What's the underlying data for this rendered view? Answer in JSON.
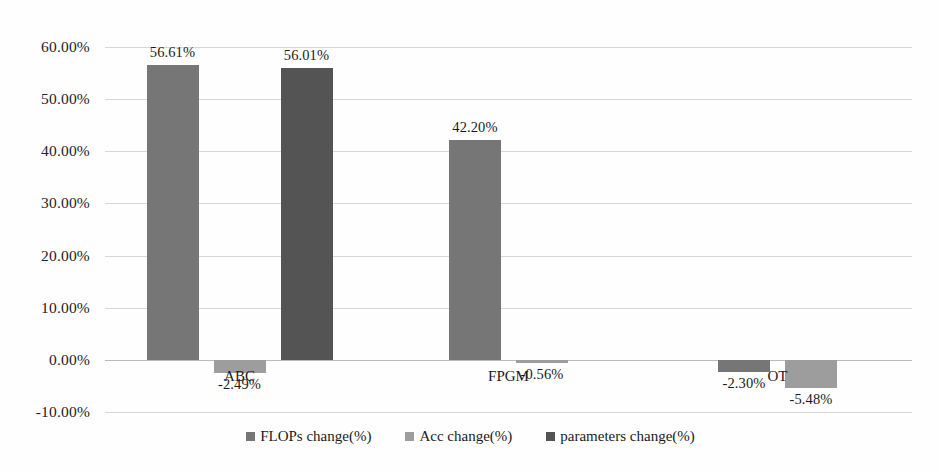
{
  "chart_data": {
    "type": "bar",
    "title": "",
    "xlabel": "",
    "ylabel": "",
    "categories": [
      "ABC",
      "FPGM",
      "OT"
    ],
    "ylim": [
      -10,
      60
    ],
    "yticks": [
      60,
      50,
      40,
      30,
      20,
      10,
      0,
      -10
    ],
    "ytick_labels": [
      "60.00%",
      "50.00%",
      "40.00%",
      "30.00%",
      "20.00%",
      "10.00%",
      "0.00%",
      "-10.00%"
    ],
    "grid": true,
    "legend_position": "bottom-center",
    "series": [
      {
        "name": "FLOPs change(%)",
        "color": "#767676",
        "values": [
          56.61,
          42.2,
          -2.3
        ],
        "labels": [
          "56.61%",
          "42.20%",
          "-2.30%"
        ]
      },
      {
        "name": "Acc change(%)",
        "color": "#9d9d9d",
        "values": [
          -2.49,
          -0.56,
          -5.48
        ],
        "labels": [
          "-2.49%",
          "-0.56%",
          "-5.48%"
        ]
      },
      {
        "name": "parameters change(%)",
        "color": "#545454",
        "values": [
          56.01,
          null,
          null
        ],
        "labels": [
          "56.01%",
          "",
          ""
        ]
      }
    ]
  },
  "axis": {
    "ticks": [
      {
        "label": "60.00%",
        "value": 60
      },
      {
        "label": "50.00%",
        "value": 50
      },
      {
        "label": "40.00%",
        "value": 40
      },
      {
        "label": "30.00%",
        "value": 30
      },
      {
        "label": "20.00%",
        "value": 20
      },
      {
        "label": "10.00%",
        "value": 10
      },
      {
        "label": "0.00%",
        "value": 0
      },
      {
        "label": "-10.00%",
        "value": -10
      }
    ]
  },
  "categories": [
    {
      "label": "ABC"
    },
    {
      "label": "FPGM"
    },
    {
      "label": "OT"
    }
  ],
  "legend": {
    "items": [
      {
        "label": "FLOPs change(%)",
        "series": "flops"
      },
      {
        "label": "Acc change(%)",
        "series": "acc"
      },
      {
        "label": "parameters change(%)",
        "series": "parameters"
      }
    ]
  },
  "bars": [
    {
      "category": "ABC",
      "series": "flops",
      "value": 56.61,
      "label": "56.61%"
    },
    {
      "category": "ABC",
      "series": "acc",
      "value": -2.49,
      "label": "-2.49%"
    },
    {
      "category": "ABC",
      "series": "parameters",
      "value": 56.01,
      "label": "56.01%"
    },
    {
      "category": "FPGM",
      "series": "flops",
      "value": 42.2,
      "label": "42.20%"
    },
    {
      "category": "FPGM",
      "series": "acc",
      "value": -0.56,
      "label": "-0.56%"
    },
    {
      "category": "OT",
      "series": "flops",
      "value": -2.3,
      "label": "-2.30%"
    },
    {
      "category": "OT",
      "series": "acc",
      "value": -5.48,
      "label": "-5.48%"
    }
  ]
}
